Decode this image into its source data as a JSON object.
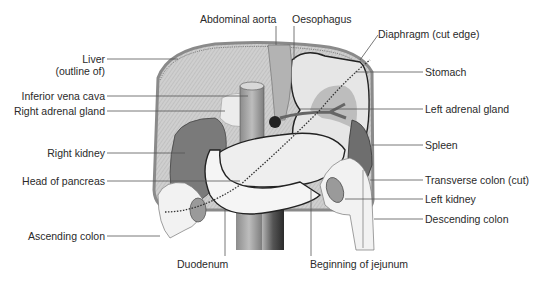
{
  "diagram": {
    "type": "anatomical-illustration",
    "colors": {
      "background": "#ffffff",
      "label_text": "#2a2a2a",
      "leader_line": "#555555",
      "liver_fill": "#c9c9c9",
      "liver_hatch": "#a8a8a8",
      "stomach_fill": "#e4e4e4",
      "dark_organ": "#6e6e6e",
      "kidney_fill": "#7a7a7a",
      "pancreas_fill": "#efefef",
      "duodenum_fill": "#f4f4f4",
      "vessel_fill": "#9a9a9a",
      "colon_fill": "#f2f2f2"
    },
    "labels_left": [
      {
        "text": "Liver",
        "text2": "(outline of)"
      },
      {
        "text": "Inferior vena cava"
      },
      {
        "text": "Right adrenal gland"
      },
      {
        "text": "Right kidney"
      },
      {
        "text": "Head of pancreas"
      },
      {
        "text": "Ascending colon"
      }
    ],
    "labels_top": [
      {
        "text": "Abdominal aorta"
      },
      {
        "text": "Oesophagus"
      }
    ],
    "labels_right": [
      {
        "text": "Diaphragm (cut edge)"
      },
      {
        "text": "Stomach"
      },
      {
        "text": "Left adrenal gland"
      },
      {
        "text": "Spleen"
      },
      {
        "text": "Transverse colon (cut)"
      },
      {
        "text": "Left kidney"
      },
      {
        "text": "Descending colon"
      }
    ],
    "labels_bottom": [
      {
        "text": "Duodenum"
      },
      {
        "text": "Beginning of jejunum"
      }
    ]
  }
}
